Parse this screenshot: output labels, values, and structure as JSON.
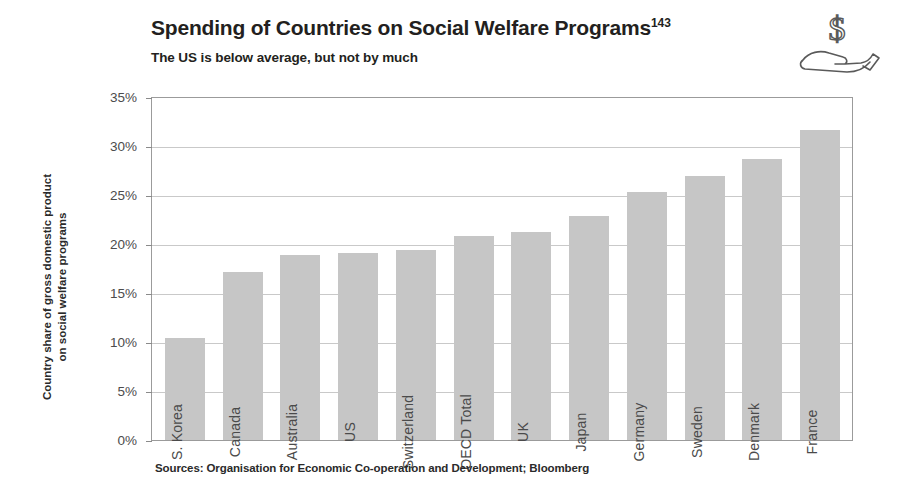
{
  "header": {
    "title": "Spending of Countries on Social Welfare Programs",
    "title_superscript": "143",
    "subtitle": "The US is below average, but not by much",
    "icon": "hand-holding-dollar-icon"
  },
  "source_note": "Sources: Organisation for Economic Co-operation and Development; Bloomberg",
  "colors": {
    "bar_fill": "#c6c6c6",
    "gridline": "#c9c9c9",
    "axis": "#9b9b9b",
    "text": "#231f20",
    "tick_text": "#4c4c4c"
  },
  "chart_data": {
    "type": "bar",
    "title": "Spending of Countries on Social Welfare Programs",
    "subtitle": "The US is below average, but not by much",
    "xlabel": "",
    "ylabel": "Country share of gross domestic product on social welfare programs",
    "ylabel_lines": [
      "Country share of gross domestic product",
      "on social welfare programs"
    ],
    "ylim": [
      0,
      35
    ],
    "yticks": [
      0,
      5,
      10,
      15,
      20,
      25,
      30,
      35
    ],
    "ytick_labels": [
      "0%",
      "5%",
      "10%",
      "15%",
      "20%",
      "25%",
      "30%",
      "35%"
    ],
    "grid": true,
    "legend": false,
    "units": "percent of GDP",
    "categories": [
      "S. Korea",
      "Canada",
      "Australia",
      "US",
      "Switzerland",
      "OECD Total",
      "UK",
      "Japan",
      "Germany",
      "Sweden",
      "Denmark",
      "France"
    ],
    "values": [
      10.4,
      17.1,
      18.9,
      19.1,
      19.4,
      20.8,
      21.2,
      22.9,
      25.3,
      26.9,
      28.7,
      31.6
    ],
    "source": "Sources: Organisation for Economic Co-operation and Development; Bloomberg"
  }
}
